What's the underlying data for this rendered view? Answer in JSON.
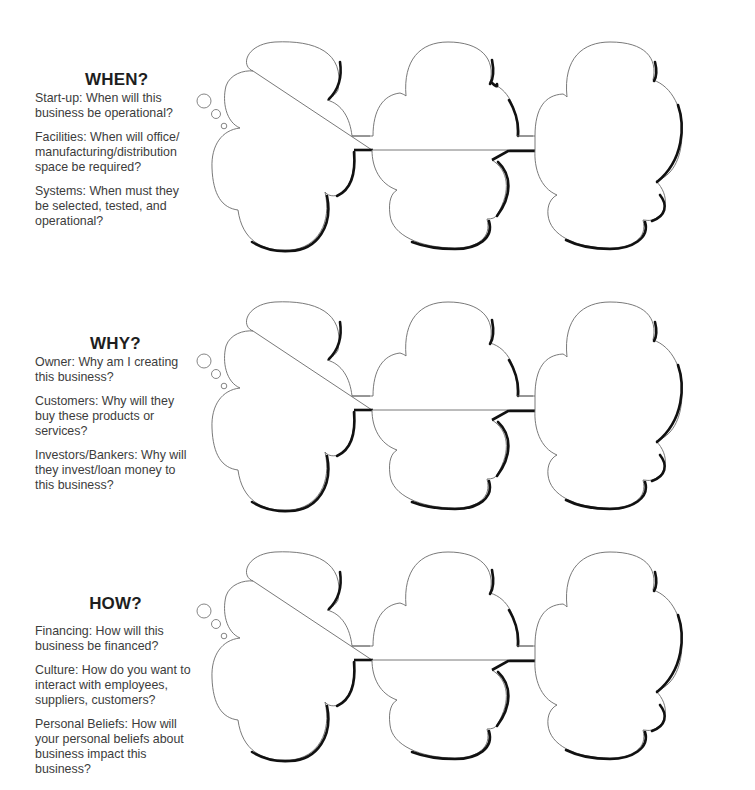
{
  "sections": [
    {
      "heading": "WHEN?",
      "paragraphs": [
        "Start-up: When will this business be operational?",
        "Facilities: When will office/ manufacturing/distribution space be required?",
        "Systems: When must they be selected, tested, and operational?"
      ],
      "clouds": [
        "",
        "",
        ""
      ]
    },
    {
      "heading": "WHY?",
      "paragraphs": [
        "Owner: Why am I creating this business?",
        "Customers: Why will they buy these products or services?",
        "Investors/Bankers: Why will they invest/loan money to this business?"
      ],
      "clouds": [
        "",
        "",
        ""
      ]
    },
    {
      "heading": "HOW?",
      "paragraphs": [
        "Financing: How will this business be financed?",
        "Culture: How do you want to interact with employees, suppliers, customers?",
        "Personal Beliefs: How will your personal beliefs about business impact this business?"
      ],
      "clouds": [
        "",
        "",
        ""
      ]
    }
  ],
  "icons": {
    "thought_bubble": "thought-cloud-shape"
  },
  "colors": {
    "text": "#3c3c3c",
    "heading": "#1e1e1e",
    "outline": "#6a6a6a",
    "shadow": "#111111",
    "background": "#ffffff"
  }
}
